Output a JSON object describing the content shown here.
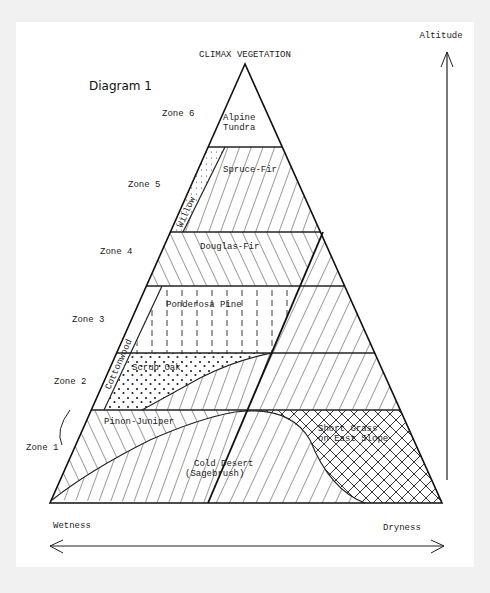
{
  "diagram": {
    "title": "Diagram 1",
    "heading": "CLIMAX VEGETATION",
    "axes": {
      "vertical_label": "Altitude",
      "horizontal_left_label": "Wetness",
      "horizontal_right_label": "Dryness"
    },
    "zones": [
      {
        "label": "Zone 6"
      },
      {
        "label": "Zone 5"
      },
      {
        "label": "Zone 4"
      },
      {
        "label": "Zone 3"
      },
      {
        "label": "Zone 2"
      },
      {
        "label": "Zone 1"
      }
    ],
    "vegetation": {
      "alpine_line1": "Alpine",
      "alpine_line2": "Tundra",
      "spruce_fir": "Spruce-Fir",
      "willow": "Willow",
      "douglas_fir": "Douglas-Fir",
      "ponderosa": "Ponderosa Pine",
      "cottonwood": "Cottonwood",
      "scrub_oak": "Scrub Oak",
      "pinon_juniper": "Pinon-Juniper",
      "cold_desert_line1": "Cold Desert",
      "cold_desert_line2": "(Sagebrush)",
      "short_grass_line1": "Short Grass",
      "short_grass_line2": "on East Slope"
    },
    "colors": {
      "ink": "#1a1a1a",
      "paper": "#ffffff",
      "background": "#f1f1f1"
    }
  }
}
